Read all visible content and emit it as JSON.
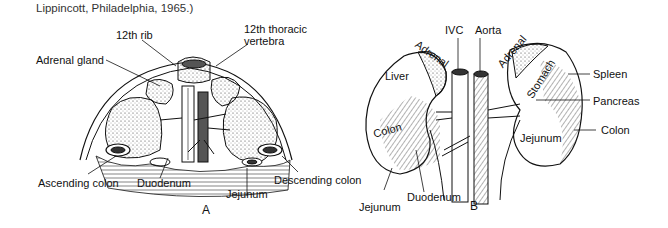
{
  "caption": "Lippincott, Philadelphia, 1965.)",
  "panel_a": {
    "letter": "A",
    "labels": {
      "rib": "12th rib",
      "vertebra_line1": "12th thoracic",
      "vertebra_line2": "vertebra",
      "adrenal": "Adrenal gland",
      "ascending_colon": "Ascending colon",
      "duodenum": "Duodenum",
      "jejunum": "Jejunum",
      "descending_colon": "Descending colon"
    }
  },
  "panel_b": {
    "letter": "B",
    "labels": {
      "ivc": "IVC",
      "aorta": "Aorta",
      "adrenal_left": "Adrenal",
      "adrenal_right": "Adrenal",
      "liver": "Liver",
      "stomach": "Stomach",
      "spleen": "Spleen",
      "pancreas": "Pancreas",
      "colon_left": "Colon",
      "colon_right": "Colon",
      "jejunum_right": "Jejunum",
      "duodenum": "Duodenum",
      "jejunum_bottom": "Jejunum"
    }
  }
}
